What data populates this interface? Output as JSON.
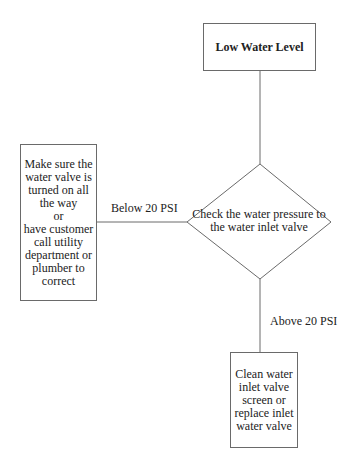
{
  "diagram": {
    "type": "flowchart",
    "nodes": {
      "start": {
        "shape": "rectangle",
        "text": "Low Water Level"
      },
      "decision": {
        "shape": "diamond",
        "text": "Check the water pressure to\nthe water inlet valve"
      },
      "left_action": {
        "shape": "rectangle",
        "text": "Make sure the\nwater valve is\nturned on all\nthe way\nor\nhave customer\ncall utility\ndepartment or\nplumber to\ncorrect"
      },
      "bottom_action": {
        "shape": "rectangle",
        "text": "Clean water\ninlet valve\nscreen or\nreplace inlet\nwater valve"
      }
    },
    "edges": {
      "start_to_decision": {
        "label": ""
      },
      "decision_to_left": {
        "label": "Below 20 PSI"
      },
      "decision_to_bottom": {
        "label": "Above 20 PSI"
      }
    },
    "colors": {
      "line": "#6a6a6a",
      "text": "#222222",
      "background": "#ffffff"
    }
  }
}
